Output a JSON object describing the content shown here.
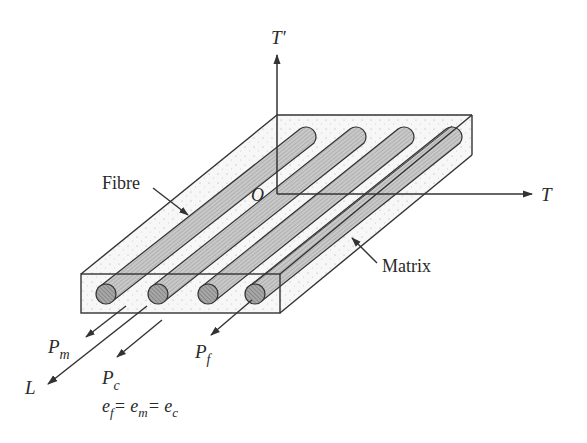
{
  "figure": {
    "axes": {
      "vertical": "T'",
      "horizontal": "T",
      "longitudinal": "L",
      "origin": "O"
    },
    "labels": {
      "fibre": "Fibre",
      "matrix": "Matrix"
    },
    "loads": {
      "matrix": {
        "base": "P",
        "sub": "m"
      },
      "composite": {
        "base": "P",
        "sub": "c"
      },
      "fibre": {
        "base": "P",
        "sub": "f"
      }
    },
    "equation": {
      "t1": "e",
      "s1": "f",
      "t2": "= e",
      "s2": "m",
      "t3": "= e",
      "s3": "c"
    },
    "fibre_count": 4,
    "colors": {
      "line": "#333333",
      "fibre_fill": "#b8b8b8",
      "matrix_fill": "#f4f4f4"
    }
  }
}
